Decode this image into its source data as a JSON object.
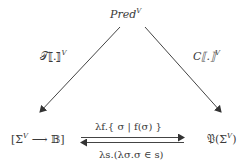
{
  "diagram": {
    "type": "commutative-diagram",
    "nodes": {
      "top": {
        "base": "Pred",
        "sup": "V"
      },
      "bottom_left": {
        "open": "[Σ",
        "sup": "V",
        "arrow": " ⟶ ",
        "set": "𝔹",
        "close": "]"
      },
      "bottom_right": {
        "base": "𝔓(Σ",
        "sup": "V",
        "close": ")"
      }
    },
    "edges": {
      "left_diagonal": {
        "from": "top",
        "to": "bottom_left",
        "label_base": "𝒯⟦.⟧",
        "label_sup": "V"
      },
      "right_diagonal": {
        "from": "top",
        "to": "bottom_right",
        "label_base": "C⟦.⟧",
        "label_sup": "V"
      },
      "top_horizontal": {
        "from": "bottom_left",
        "to": "bottom_right",
        "label": "λf.{ σ | f(σ) }"
      },
      "bottom_horizontal": {
        "from": "bottom_right",
        "to": "bottom_left",
        "label": "λs.(λσ.σ ∈ s)"
      }
    },
    "colors": {
      "stroke": "#444444",
      "text": "#3a3a3a",
      "background": "#ffffff"
    }
  }
}
